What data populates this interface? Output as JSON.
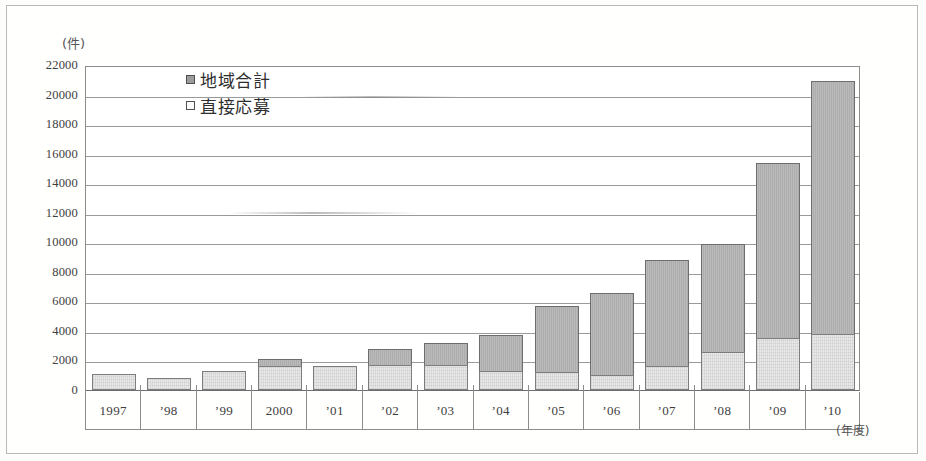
{
  "chart_data": {
    "type": "bar",
    "subtype": "stacked-bar",
    "title": "",
    "xlabel": "(年度)",
    "ylabel": "(件)",
    "ylim": [
      0,
      22000
    ],
    "ytick_step": 2000,
    "grid": true,
    "legend_position": "top-left-inside",
    "categories": [
      "1997",
      "’98",
      "’99",
      "2000",
      "’01",
      "’02",
      "’03",
      "’04",
      "’05",
      "’06",
      "’07",
      "’08",
      "’09",
      "’10"
    ],
    "ytick_labels": [
      "22000",
      "20000",
      "18000",
      "16000",
      "14000",
      "12000",
      "10000",
      "8000",
      "6000",
      "4000",
      "2000",
      "0"
    ],
    "ytick_values": [
      22000,
      20000,
      18000,
      16000,
      14000,
      12000,
      10000,
      8000,
      6000,
      4000,
      2000,
      0
    ],
    "series": [
      {
        "name": "地域合計",
        "role": "total",
        "color": "#adadad",
        "values": [
          1100,
          800,
          1300,
          2100,
          1600,
          2800,
          3200,
          3700,
          5700,
          6600,
          8800,
          9900,
          15400,
          20900
        ]
      },
      {
        "name": "直接応募",
        "role": "direct",
        "color": "#e9e9e9",
        "values": [
          1100,
          800,
          1300,
          1600,
          1600,
          1700,
          1700,
          1300,
          1200,
          1000,
          1600,
          2600,
          3500,
          3800
        ]
      }
    ]
  },
  "legend": {
    "items": [
      {
        "label": "地域合計",
        "swatch": "filled-square-icon"
      },
      {
        "label": "直接応募",
        "swatch": "empty-square-icon"
      }
    ]
  },
  "axes": {
    "y_unit_label": "(件)",
    "x_unit_label": "(年度)"
  }
}
